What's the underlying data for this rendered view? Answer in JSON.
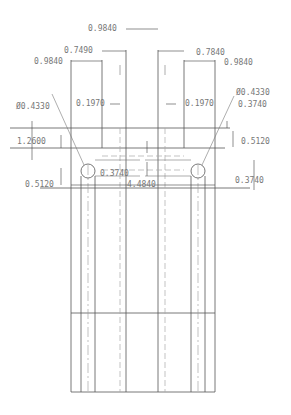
{
  "drawing": {
    "units_precision": 4,
    "dimensions": {
      "top_center_width": "0.9840",
      "left_inner_width": "0.7490",
      "left_outer_width": "0.9840",
      "right_inner_width": "0.7840",
      "right_outer_width": "0.9840",
      "left_gap": "0.1970",
      "right_gap": "0.1970",
      "left_hole_diameter": "Ø0.4330",
      "right_hole_diameter": "Ø0.4330",
      "right_top_offset": "0.3740",
      "left_height": "1.2600",
      "right_mid_height": "0.5120",
      "center_offset": "0.3740",
      "right_lower_offset": "0.3740",
      "left_lower_offset": "0.5120",
      "overall_width": "4.4840"
    }
  }
}
